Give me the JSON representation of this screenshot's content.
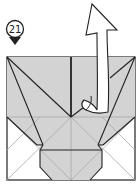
{
  "diagram": {
    "type": "origami-step",
    "step": {
      "number": "21"
    },
    "colors": {
      "paper_gray": "#d3d3d3",
      "paper_white": "#ffffff",
      "line": "#222222",
      "crease": "#a8a8a8",
      "arrow_fill": "#ffffff"
    },
    "elements": [
      {
        "name": "step-marker",
        "label": "21"
      },
      {
        "name": "folded-paper-square"
      },
      {
        "name": "unfold-arrow",
        "direction": "up"
      }
    ]
  }
}
